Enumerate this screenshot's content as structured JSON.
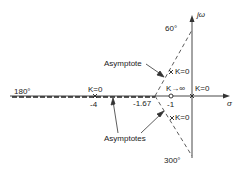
{
  "diagram": {
    "type": "root-locus",
    "axes": {
      "real_label": "σ",
      "imag_label": "jω"
    },
    "angles": {
      "a60": "60°",
      "a180": "180°",
      "a300": "300°"
    },
    "poles": [
      {
        "label": "K=0",
        "value": "-4"
      },
      {
        "label": "K=0",
        "value": "0"
      },
      {
        "label": "K=0",
        "value": "upper complex"
      },
      {
        "label": "K=0",
        "value": "lower complex"
      }
    ],
    "zero": {
      "label": "K→∞",
      "value": "-1"
    },
    "centroid": "-1.67",
    "tick_labels": {
      "minus4": "-4",
      "minus1": "-1",
      "centroid": "-1.67"
    },
    "annotations": {
      "asymptote": "Asymptote",
      "asymptotes": "Asymptotes"
    }
  }
}
